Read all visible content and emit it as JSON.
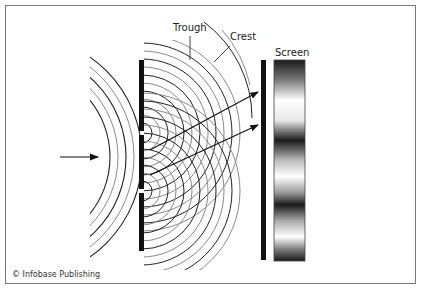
{
  "diagram": {
    "labels": {
      "trough": "Trough",
      "crest": "Crest",
      "screen": "Screen"
    },
    "credit": "© Infobase Publishing",
    "elements": {
      "incident_arrow": "arrow-right",
      "barrier": "double-slit barrier",
      "screen": "interference pattern screen with alternating light and dark bands",
      "rays": 2
    },
    "colors": {
      "frame": "#7a7a7a",
      "crest_line": "#222222",
      "trough_line": "#8a8a8a",
      "barrier": "#111111"
    }
  }
}
